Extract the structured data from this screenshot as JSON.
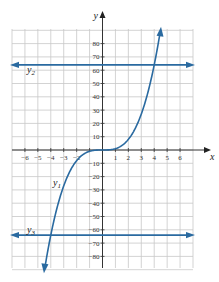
{
  "chart_data": {
    "type": "line",
    "title": "",
    "xlabel": "x",
    "ylabel": "y",
    "xlim": [
      -7,
      7
    ],
    "ylim": [
      -90,
      90
    ],
    "grid": true,
    "x_ticks": [
      -6,
      -5,
      -4,
      -3,
      -2,
      -1,
      1,
      2,
      3,
      4,
      5,
      6
    ],
    "x_tick_labels": [
      "−6",
      "−5",
      "−4",
      "−3",
      "−2",
      "",
      "1",
      "2",
      "3",
      "4",
      "5",
      "6"
    ],
    "y_ticks": [
      80,
      70,
      60,
      50,
      40,
      30,
      20,
      10,
      -10,
      -20,
      -30,
      -40,
      -50,
      -60,
      -70,
      -80
    ],
    "y_tick_labels": [
      "80",
      "70",
      "60",
      "50",
      "40",
      "30",
      "20",
      "10",
      "−10",
      "−20",
      "−30",
      "−40",
      "−50",
      "−60",
      "−70",
      "−80"
    ],
    "series": [
      {
        "name": "y1",
        "label": "y",
        "sub": "1",
        "function": "x^3",
        "x_range": [
          -4.45,
          4.45
        ],
        "color": "#2a6aa0"
      },
      {
        "name": "y2",
        "label": "y",
        "sub": "2",
        "function": "64",
        "value": 64,
        "color": "#2a6aa0"
      },
      {
        "name": "y3",
        "label": "y",
        "sub": "3",
        "function": "-64",
        "value": -64,
        "color": "#2a6aa0"
      }
    ]
  }
}
